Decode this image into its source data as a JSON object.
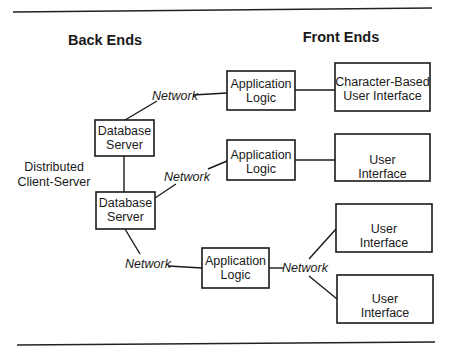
{
  "diagram": {
    "headers": {
      "back_ends": "Back Ends",
      "front_ends": "Front Ends"
    },
    "side_label": {
      "line1": "Distributed",
      "line2": "Client-Server"
    },
    "network_label": "Network",
    "nodes": {
      "db_server_1": {
        "line1": "Database",
        "line2": "Server"
      },
      "db_server_2": {
        "line1": "Database",
        "line2": "Server"
      },
      "app_logic_1": {
        "line1": "Application",
        "line2": "Logic"
      },
      "app_logic_2": {
        "line1": "Application",
        "line2": "Logic"
      },
      "app_logic_3": {
        "line1": "Application",
        "line2": "Logic"
      },
      "ui_char": {
        "line1": "Character-Based",
        "line2": "User Interface"
      },
      "ui_2": {
        "line1": "User",
        "line2": "Interface"
      },
      "ui_3": {
        "line1": "User",
        "line2": "Interface"
      },
      "ui_4": {
        "line1": "User",
        "line2": "Interface"
      }
    },
    "edges": [
      {
        "from": "db_server_1",
        "to": "app_logic_1",
        "via": "Network"
      },
      {
        "from": "db_server_1",
        "to": "db_server_2",
        "via": ""
      },
      {
        "from": "db_server_2",
        "to": "app_logic_2",
        "via": "Network"
      },
      {
        "from": "db_server_2",
        "to": "app_logic_3",
        "via": "Network"
      },
      {
        "from": "app_logic_1",
        "to": "ui_char",
        "via": ""
      },
      {
        "from": "app_logic_2",
        "to": "ui_2",
        "via": ""
      },
      {
        "from": "app_logic_3",
        "to": "ui_3",
        "via": "Network"
      },
      {
        "from": "app_logic_3",
        "to": "ui_4",
        "via": "Network"
      }
    ]
  }
}
